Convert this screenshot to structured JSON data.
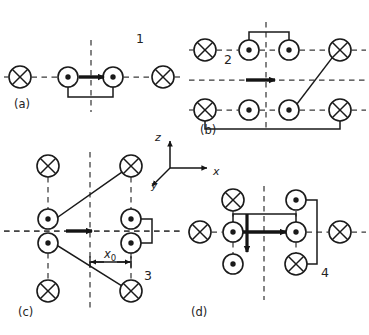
{
  "figure": {
    "type": "physics-schematic",
    "width": 369,
    "height": 335,
    "stroke_color": "#1a1a1a",
    "dash_color": "#3a3a3a",
    "background": "#ffffff"
  },
  "panels": [
    {
      "id": "a",
      "label": "(a)",
      "number": "1",
      "label_pos": {
        "x": 14,
        "y": 104
      },
      "number_pos": {
        "x": 136,
        "y": 38
      },
      "origin": {
        "x": 0,
        "y": 0
      },
      "axis_y": 77,
      "axis_x": 91,
      "h_axis": {
        "x1": 4,
        "x2": 182
      },
      "v_axis": {
        "y1": 40,
        "y2": 112
      },
      "conductors": [
        {
          "kind": "cross",
          "cx": 20,
          "cy": 77,
          "r": 11
        },
        {
          "kind": "dot",
          "cx": 68,
          "cy": 77,
          "r": 10
        },
        {
          "kind": "dot",
          "cx": 113,
          "cy": 77,
          "r": 10
        },
        {
          "kind": "cross",
          "cx": 163,
          "cy": 77,
          "r": 11
        }
      ],
      "wires": [
        {
          "points": "68,87 68,97 113,97 113,87"
        }
      ],
      "arrows": [
        {
          "dir": "right",
          "x1": 79,
          "y1": 77,
          "x2": 104,
          "y2": 77
        }
      ]
    },
    {
      "id": "b",
      "label": "(b)",
      "number": "2",
      "label_pos": {
        "x": 200,
        "y": 130
      },
      "number_pos": {
        "x": 224,
        "y": 59
      },
      "axis_y": 80,
      "axis_x": 266,
      "h_axis": {
        "x1": 189,
        "x2": 366
      },
      "v_axis": {
        "y1": 22,
        "y2": 132
      },
      "rows": [
        50,
        110
      ],
      "conductors": [
        {
          "kind": "cross",
          "cx": 205,
          "cy": 50,
          "r": 11
        },
        {
          "kind": "dot",
          "cx": 249,
          "cy": 50,
          "r": 10
        },
        {
          "kind": "dot",
          "cx": 289,
          "cy": 50,
          "r": 10
        },
        {
          "kind": "cross",
          "cx": 340,
          "cy": 50,
          "r": 11
        },
        {
          "kind": "cross",
          "cx": 205,
          "cy": 110,
          "r": 11
        },
        {
          "kind": "dot",
          "cx": 249,
          "cy": 110,
          "r": 10
        },
        {
          "kind": "dot",
          "cx": 289,
          "cy": 110,
          "r": 10
        },
        {
          "kind": "cross",
          "cx": 340,
          "cy": 110,
          "r": 11
        }
      ],
      "wires": [
        {
          "points": "249,40 249,32 289,32 289,40"
        },
        {
          "points": "205,121 205,129 340,129 340,121"
        },
        {
          "points": "297,104 332,58"
        }
      ],
      "arrows": [
        {
          "dir": "right",
          "x1": 246,
          "y1": 80,
          "x2": 275,
          "y2": 80
        }
      ]
    },
    {
      "id": "c",
      "label": "(c)",
      "number": "3",
      "label_pos": {
        "x": 18,
        "y": 312
      },
      "number_pos": {
        "x": 144,
        "y": 275
      },
      "axis_y": 231,
      "axis_x": 90,
      "h_axis": {
        "x1": 4,
        "x2": 180
      },
      "v_axis": {
        "y1": 152,
        "y2": 312
      },
      "conductors": [
        {
          "kind": "cross",
          "cx": 48,
          "cy": 166,
          "r": 11
        },
        {
          "kind": "cross",
          "cx": 131,
          "cy": 166,
          "r": 11
        },
        {
          "kind": "dot",
          "cx": 48,
          "cy": 219,
          "r": 10
        },
        {
          "kind": "dot",
          "cx": 131,
          "cy": 219,
          "r": 10
        },
        {
          "kind": "dot",
          "cx": 48,
          "cy": 243,
          "r": 10
        },
        {
          "kind": "dot",
          "cx": 131,
          "cy": 243,
          "r": 10
        },
        {
          "kind": "cross",
          "cx": 48,
          "cy": 291,
          "r": 11
        },
        {
          "kind": "cross",
          "cx": 131,
          "cy": 291,
          "r": 11
        }
      ],
      "v_dashes": [
        {
          "x": 48,
          "y1": 177,
          "y2": 209
        },
        {
          "x": 48,
          "y1": 253,
          "y2": 280
        },
        {
          "x": 131,
          "y1": 177,
          "y2": 209
        },
        {
          "x": 131,
          "y1": 253,
          "y2": 280
        }
      ],
      "wires": [
        {
          "points": "58,217 122,172"
        },
        {
          "points": "58,246 122,286"
        },
        {
          "points": "141,219 152,219 152,243 141,243"
        }
      ],
      "arrows": [
        {
          "dir": "right",
          "x1": 66,
          "y1": 231,
          "x2": 92,
          "y2": 231
        }
      ],
      "dimension": {
        "text": "x",
        "subscript": "0",
        "label_pos": {
          "x": 104,
          "y": 254
        },
        "x1": 90,
        "x2": 131,
        "y": 262
      }
    },
    {
      "id": "d",
      "label": "(d)",
      "number": "4",
      "label_pos": {
        "x": 191,
        "y": 312
      },
      "number_pos": {
        "x": 321,
        "y": 272
      },
      "axis_y": 232,
      "axis_x": 264,
      "h_axis": {
        "x1": 188,
        "x2": 366
      },
      "v_axis": {
        "y1": 186,
        "y2": 300
      },
      "conductors": [
        {
          "kind": "cross",
          "cx": 233,
          "cy": 200,
          "r": 11
        },
        {
          "kind": "dot",
          "cx": 296,
          "cy": 200,
          "r": 10
        },
        {
          "kind": "cross",
          "cx": 200,
          "cy": 232,
          "r": 11
        },
        {
          "kind": "dot",
          "cx": 233,
          "cy": 232,
          "r": 10
        },
        {
          "kind": "dot",
          "cx": 296,
          "cy": 232,
          "r": 10
        },
        {
          "kind": "cross",
          "cx": 340,
          "cy": 232,
          "r": 11
        },
        {
          "kind": "dot",
          "cx": 233,
          "cy": 264,
          "r": 10
        },
        {
          "kind": "cross",
          "cx": 296,
          "cy": 264,
          "r": 11
        }
      ],
      "v_dashes": [
        {
          "x": 233,
          "y1": 211,
          "y2": 222
        },
        {
          "x": 233,
          "y1": 242,
          "y2": 254
        },
        {
          "x": 296,
          "y1": 211,
          "y2": 222
        },
        {
          "x": 296,
          "y1": 242,
          "y2": 254
        }
      ],
      "wires": [
        {
          "points": "233,222 233,214 296,214 296,222"
        },
        {
          "points": "306,200 317,200 317,264 306,264"
        }
      ],
      "arrows": [
        {
          "dir": "right",
          "x1": 243,
          "y1": 232,
          "x2": 286,
          "y2": 232
        },
        {
          "dir": "down",
          "x1": 247,
          "y1": 214,
          "x2": 247,
          "y2": 252
        }
      ]
    }
  ],
  "coordinate_axes": {
    "name": "coordinate-triad",
    "origin": {
      "x": 170,
      "y": 168
    },
    "z": {
      "label": "z",
      "label_pos": {
        "x": 155,
        "y": 137
      },
      "x2": 170,
      "y2": 141
    },
    "x": {
      "label": "x",
      "label_pos": {
        "x": 213,
        "y": 172
      },
      "x2": 207,
      "y2": 168
    },
    "y": {
      "label": "y",
      "label_pos": {
        "x": 151,
        "y": 186
      },
      "x2": 152,
      "y2": 186
    }
  },
  "legend": {
    "cross_meaning": "current into page",
    "dot_meaning": "current out of page"
  }
}
